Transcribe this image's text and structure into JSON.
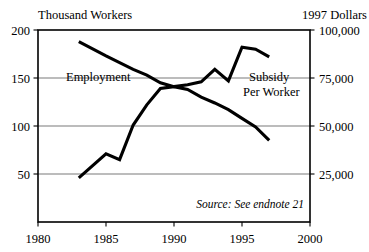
{
  "figure": {
    "left_axis_title": "Thousand Workers",
    "right_axis_title": "1997 Dollars",
    "source_note": "Source: See endnote 21",
    "series_label_left": "Employment",
    "series_label_right_line1": "Subsidy",
    "series_label_right_line2": "Per Worker",
    "line_color": "#000000",
    "grid_color": "#000000",
    "background_color": "#ffffff"
  },
  "chart_data": {
    "type": "line",
    "title": "",
    "subtitle": "",
    "xlabel": "",
    "ylabel": "Thousand Workers",
    "y2label": "1997 Dollars",
    "xlim": [
      1980,
      2000
    ],
    "ylim": [
      0,
      200
    ],
    "y2lim": [
      0,
      100000
    ],
    "xticks": [
      1980,
      1985,
      1990,
      1995,
      2000
    ],
    "xtick_labels": [
      "1980",
      "1985",
      "1990",
      "1995",
      "2000"
    ],
    "yticks": [
      50,
      100,
      150,
      200
    ],
    "ytick_labels": [
      "50",
      "100",
      "150",
      "200"
    ],
    "y2ticks": [
      25000,
      50000,
      75000,
      100000
    ],
    "y2tick_labels": [
      "25,000",
      "50,000",
      "75,000",
      "100,000"
    ],
    "grid": true,
    "gridlines_y": [
      50,
      100,
      150,
      200
    ],
    "legend": "inline-annotations",
    "annotations": [
      {
        "text": "Employment",
        "x": 1984.4,
        "y": 152,
        "align": "left"
      },
      {
        "text": "Subsidy",
        "x": 1996.3,
        "y": 152,
        "align": "left"
      },
      {
        "text": "Per Worker",
        "x": 1996.0,
        "y": 140,
        "align": "left"
      },
      {
        "text": "Source: See endnote 21",
        "x": 1998.8,
        "y": 18,
        "align": "right"
      }
    ],
    "series": [
      {
        "name": "Employment",
        "axis": "left",
        "units": "thousand workers",
        "x": [
          1983,
          1985,
          1987,
          1988,
          1989,
          1990,
          1991,
          1992,
          1993,
          1994,
          1995,
          1996,
          1997
        ],
        "values": [
          188,
          173,
          159,
          153,
          145,
          141,
          138,
          130,
          124,
          117,
          108,
          99,
          85
        ]
      },
      {
        "name": "Subsidy Per Worker",
        "axis": "right",
        "units": "1997 dollars",
        "x": [
          1983,
          1985,
          1986,
          1987,
          1988,
          1989,
          1990,
          1991,
          1992,
          1993,
          1994,
          1995,
          1996,
          1997
        ],
        "values": [
          23000,
          35500,
          32500,
          50500,
          61000,
          69500,
          70500,
          71500,
          73000,
          79500,
          73500,
          91000,
          90000,
          86000
        ],
        "values_left_scale": [
          46,
          71,
          65,
          101,
          122,
          139,
          141,
          143,
          146,
          159,
          147,
          182,
          180,
          172
        ]
      }
    ]
  }
}
